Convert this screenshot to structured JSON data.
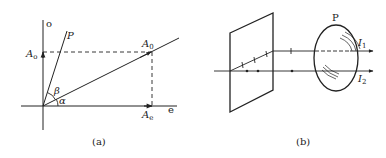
{
  "panels": [
    {
      "id": "a",
      "caption": "(a)",
      "axes": {
        "vertical_label": "o",
        "horizontal_label": "e"
      },
      "vectors": {
        "resultant": {
          "label": "A",
          "subscript": "0"
        },
        "o_component": {
          "label": "A",
          "subscript": "o"
        },
        "e_component": {
          "label": "A",
          "subscript": "e"
        }
      },
      "line_label": "P",
      "angles": {
        "alpha": "α",
        "beta": "β"
      }
    },
    {
      "id": "b",
      "caption": "(b)",
      "analyzer_label": "P",
      "beams": [
        {
          "label": "I",
          "subscript": "1"
        },
        {
          "label": "I",
          "subscript": "2"
        }
      ]
    }
  ],
  "colors": {
    "stroke": "#222222",
    "background": "#ffffff"
  }
}
